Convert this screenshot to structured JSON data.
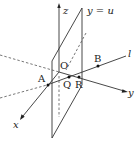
{
  "diagram": {
    "type": "3d-coordinate-figure",
    "axes": {
      "x_label": "x",
      "y_label": "y",
      "z_label": "z",
      "origin_label": "O"
    },
    "plane_label": "y = u",
    "line_label": "l",
    "points": [
      {
        "id": "A",
        "label": "A"
      },
      {
        "id": "B",
        "label": "B"
      },
      {
        "id": "Q",
        "label": "Q"
      },
      {
        "id": "R",
        "label": "R"
      }
    ],
    "colors": {
      "stroke": "#333333",
      "background": "#ffffff"
    }
  }
}
